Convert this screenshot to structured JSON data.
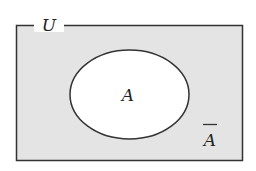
{
  "diagram": {
    "type": "venn",
    "universe_label": "U",
    "set_label": "A",
    "complement_label": "A",
    "complement_has_overbar": true,
    "colors": {
      "universe_fill": "#e4e4e4",
      "set_fill": "#ffffff",
      "stroke": "#333333"
    }
  }
}
